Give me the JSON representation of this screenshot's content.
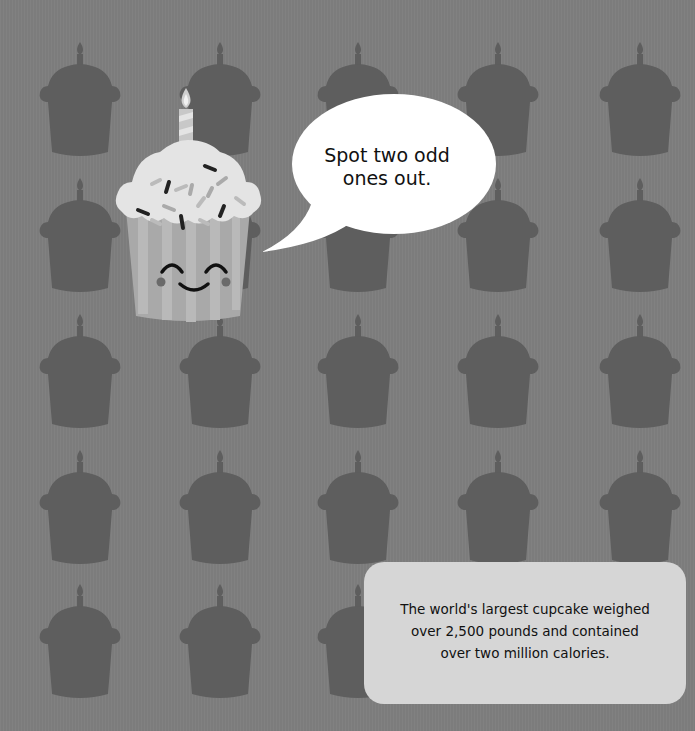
{
  "speech_bubble": {
    "text_line1": "Spot two odd",
    "text_line2": "ones out."
  },
  "fact_box": {
    "line1": "The world's largest cupcake weighed",
    "line2": "over 2,500 pounds and contained",
    "line3": "over two million calories."
  },
  "colors": {
    "background": "#7c7c7c",
    "silhouette": "#5e5e5e",
    "frosting": "#e4e4e4",
    "wrapper": "#a9a9a9",
    "bubble": "#ffffff",
    "fact_box": "#d6d6d6"
  },
  "grid": {
    "columns": 5,
    "rows": 5,
    "column_centers": [
      80,
      220,
      358,
      498,
      640
    ],
    "row_tops": [
      40,
      176,
      312,
      448,
      582
    ]
  }
}
